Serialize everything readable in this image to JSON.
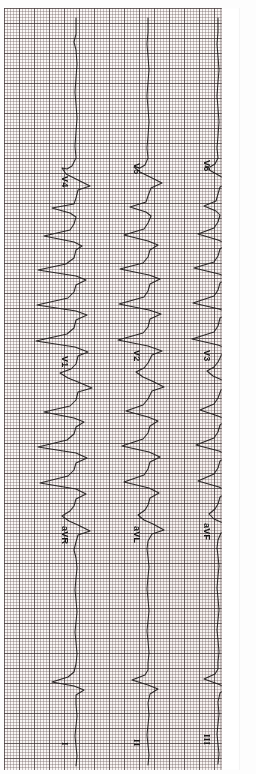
{
  "image": {
    "kind": "ecg-strip-scan",
    "orientation": "rotated-90-clockwise",
    "paper_color": "#fbf9f8",
    "grid_fine_color": "#786969",
    "grid_bold_color": "#463c3c",
    "trace_color": "#1d1a1a",
    "margin_color": "#ffffff"
  },
  "ecg": {
    "channels": [
      {
        "id": "channel-1",
        "baseline_x": 72,
        "leads": [
          {
            "label": "V4",
            "label_x": 66,
            "label_y": 168,
            "group": "precordial"
          },
          {
            "label": "V1",
            "label_x": 66,
            "label_y": 348,
            "group": "precordial"
          },
          {
            "label": "aVR",
            "label_x": 66,
            "label_y": 518,
            "group": "augmented"
          },
          {
            "label": "I",
            "label_x": 66,
            "label_y": 734,
            "group": "limb",
            "roman": true
          }
        ]
      },
      {
        "id": "channel-2",
        "baseline_x": 144,
        "leads": [
          {
            "label": "V5",
            "label_x": 138,
            "label_y": 155,
            "group": "precordial"
          },
          {
            "label": "V2",
            "label_x": 138,
            "label_y": 342,
            "group": "precordial"
          },
          {
            "label": "aVL",
            "label_x": 138,
            "label_y": 518,
            "group": "augmented"
          },
          {
            "label": "II",
            "label_x": 138,
            "label_y": 731,
            "group": "limb",
            "roman": true
          }
        ]
      },
      {
        "id": "channel-3",
        "baseline_x": 214,
        "leads": [
          {
            "label": "V6",
            "label_x": 208,
            "label_y": 152,
            "group": "precordial"
          },
          {
            "label": "V3",
            "label_x": 208,
            "label_y": 342,
            "group": "precordial"
          },
          {
            "label": "aVF",
            "label_x": 208,
            "label_y": 515,
            "group": "augmented"
          },
          {
            "label": "III",
            "label_x": 208,
            "label_y": 726,
            "group": "limb",
            "roman": true
          }
        ]
      }
    ]
  }
}
